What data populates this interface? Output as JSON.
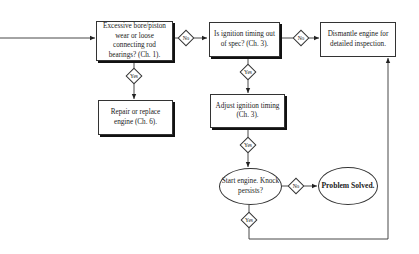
{
  "diagram": {
    "nodes": {
      "bore_wear": {
        "label": "Excessive bore/piston wear or loose connecting rod bearings? (Ch. 1)."
      },
      "repair_engine": {
        "label": "Repair or replace engine (Ch. 6)."
      },
      "ignition_timing": {
        "label": "Is ignition timing out of spec? (Ch. 3)."
      },
      "dismantle": {
        "label": "Dismantle engine for detailed inspection."
      },
      "adjust_timing": {
        "label": "Adjust ignition timing (Ch. 3)."
      },
      "start_engine": {
        "label": "Start engine. Knock persists?"
      },
      "problem_solved": {
        "label": "Problem Solved."
      }
    },
    "decisions": {
      "bore_no": "No",
      "bore_yes": "Yes",
      "timing_no": "No",
      "timing_yes": "Yes",
      "adjust_yes": "Yes",
      "knock_no": "No",
      "knock_yes": "Yes"
    },
    "edges": [
      {
        "from": "entry",
        "to": "bore_wear",
        "label": ""
      },
      {
        "from": "bore_wear",
        "to": "ignition_timing",
        "label": "No"
      },
      {
        "from": "bore_wear",
        "to": "repair_engine",
        "label": "Yes"
      },
      {
        "from": "ignition_timing",
        "to": "dismantle",
        "label": "No"
      },
      {
        "from": "ignition_timing",
        "to": "adjust_timing",
        "label": "Yes"
      },
      {
        "from": "adjust_timing",
        "to": "start_engine",
        "label": "Yes"
      },
      {
        "from": "start_engine",
        "to": "problem_solved",
        "label": "No"
      },
      {
        "from": "start_engine",
        "to": "dismantle",
        "label": "Yes"
      }
    ]
  }
}
